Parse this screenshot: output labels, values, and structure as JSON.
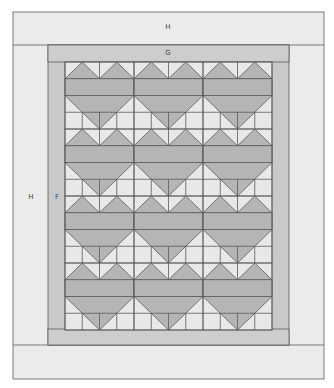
{
  "diagram": {
    "type": "quilt-layout",
    "colors": {
      "border_h": "#ebebeb",
      "border_g": "#c9c9c9",
      "border_f": "#c9c9c9",
      "background": "#e8e8e8",
      "heart": "#b5b5b5",
      "line": "#5a5a5a",
      "label": "#444444"
    },
    "labels": {
      "top_border": "H",
      "inner_top_border": "G",
      "left_border": "H",
      "inner_left_border": "F"
    },
    "grid": {
      "columns": 3,
      "rows": 4,
      "heart_count": 12
    }
  }
}
